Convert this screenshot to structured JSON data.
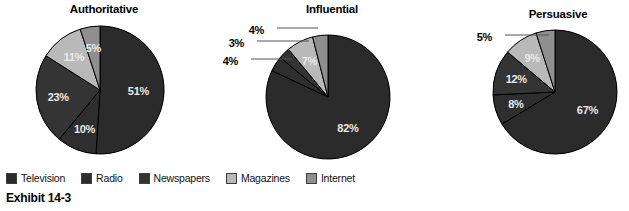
{
  "caption": "Exhibit 14-3",
  "legend": {
    "items": [
      {
        "label": "Television",
        "color": "#2b2b2b"
      },
      {
        "label": "Radio",
        "color": "#2e2e2e"
      },
      {
        "label": "Newspapers",
        "color": "#343434"
      },
      {
        "label": "Magazines",
        "color": "#b9b9b9"
      },
      {
        "label": "Internet",
        "color": "#8f8f8f"
      }
    ]
  },
  "chart_data": [
    {
      "type": "pie",
      "title": "Authoritative",
      "categories": [
        "Television",
        "Radio",
        "Newspapers",
        "Magazines",
        "Internet"
      ],
      "values": [
        51,
        10,
        23,
        11,
        5
      ],
      "labels": [
        "51%",
        "10%",
        "23%",
        "11%",
        "5%"
      ],
      "colors": [
        "#2b2b2b",
        "#2e2e2e",
        "#343434",
        "#b9b9b9",
        "#8f8f8f"
      ],
      "label_placement": [
        "inside",
        "inside",
        "inside",
        "inside",
        "inside"
      ],
      "center": [
        100,
        90
      ],
      "radius": 64,
      "start_angle": 0,
      "direction": "clockwise"
    },
    {
      "type": "pie",
      "title": "Influential",
      "categories": [
        "Television",
        "Radio",
        "Newspapers",
        "Magazines",
        "Internet"
      ],
      "values": [
        82,
        4,
        3,
        7,
        4
      ],
      "labels": [
        "82%",
        "4%",
        "3%",
        "7%",
        "4%"
      ],
      "colors": [
        "#2b2b2b",
        "#2e2e2e",
        "#343434",
        "#b9b9b9",
        "#8f8f8f"
      ],
      "label_placement": [
        "inside",
        "outside",
        "outside",
        "inside",
        "outside"
      ],
      "center": [
        328,
        97
      ],
      "radius": 62,
      "start_angle": 0,
      "direction": "clockwise"
    },
    {
      "type": "pie",
      "title": "Persuasive",
      "categories": [
        "Television",
        "Radio",
        "Newspapers",
        "Magazines",
        "Internet"
      ],
      "values": [
        67,
        8,
        12,
        9,
        5
      ],
      "labels": [
        "67%",
        "8%",
        "12%",
        "9%",
        "5%"
      ],
      "colors": [
        "#2b2b2b",
        "#2e2e2e",
        "#343434",
        "#b9b9b9",
        "#8f8f8f"
      ],
      "label_placement": [
        "inside",
        "inside",
        "inside",
        "inside",
        "outside"
      ],
      "center": [
        555,
        92
      ],
      "radius": 62,
      "start_angle": 0,
      "direction": "clockwise"
    }
  ],
  "titles": {
    "chart1": "Authoritative",
    "chart2": "Influential",
    "chart3": "Persuasive"
  },
  "title_positions": [
    {
      "x": 104,
      "y": 3
    },
    {
      "x": 332,
      "y": 3
    },
    {
      "x": 558,
      "y": 8
    }
  ],
  "outside_labels": [
    {
      "chart": 1,
      "text": "4%",
      "x": 264,
      "y": 26,
      "leader": [
        277,
        28,
        318,
        28
      ]
    },
    {
      "chart": 1,
      "text": "3%",
      "x": 244,
      "y": 39,
      "leader": [
        257,
        41,
        309,
        41
      ]
    },
    {
      "chart": 1,
      "text": "4%",
      "x": 238,
      "y": 57,
      "leader": [
        251,
        59,
        292,
        59
      ]
    },
    {
      "chart": 2,
      "text": "5%",
      "x": 492,
      "y": 33,
      "leader": [
        505,
        35,
        549,
        35
      ]
    }
  ]
}
